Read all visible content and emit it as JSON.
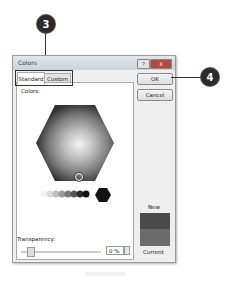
{
  "callouts": [
    {
      "number": "3",
      "target": "tabs"
    },
    {
      "number": "4",
      "target": "ok-button"
    }
  ],
  "dialog": {
    "title": "Colors",
    "title_buttons": {
      "help": "?",
      "close": "X"
    },
    "tabs": [
      {
        "label": "Standard",
        "active": true
      },
      {
        "label": "Custom",
        "active": false
      }
    ],
    "colors_label": "Colors:",
    "buttons": {
      "ok": "OK",
      "cancel": "Cancel"
    },
    "transparency": {
      "label": "Transparency:",
      "value": "0 %"
    },
    "preview": {
      "new_label": "New",
      "current_label": "Current",
      "new_color": "#4a4a4a",
      "current_color": "#6b6b6b"
    }
  }
}
